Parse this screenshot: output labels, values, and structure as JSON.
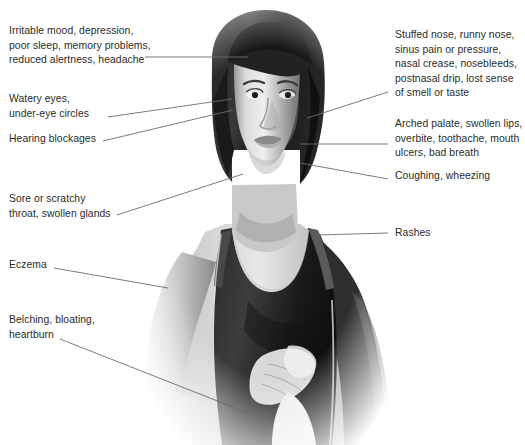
{
  "diagram": {
    "background_color": "#ffffff",
    "text_color": "#2b2b2b",
    "leader_line_color": "#6b6b6b",
    "figure_description": "Grayscale photographic illustration of a woman facing forward, shown from the head to the waist, wearing a dark sleeveless tank top, with one hand resting on her abdomen"
  },
  "labels": {
    "left": [
      {
        "id": "irritable-mood",
        "text": "Irritable mood, depression,\npoor sleep, memory problems,\nreduced alertness, headache"
      },
      {
        "id": "watery-eyes",
        "text": "Watery eyes,\nunder-eye circles"
      },
      {
        "id": "hearing-blockages",
        "text": "Hearing blockages"
      },
      {
        "id": "sore-throat",
        "text": "Sore or scratchy\nthroat, swollen glands"
      },
      {
        "id": "eczema",
        "text": "Eczema"
      },
      {
        "id": "belching",
        "text": "Belching, bloating,\nheartburn"
      }
    ],
    "right": [
      {
        "id": "stuffed-nose",
        "text": "Stuffed nose, runny nose,\nsinus pain or pressure,\nnasal crease, nosebleeds,\npostnasal drip, lost sense\nof smell or taste"
      },
      {
        "id": "arched-palate",
        "text": "Arched palate, swollen lips,\noverbite, toothache, mouth\nulcers, bad breath"
      },
      {
        "id": "coughing",
        "text": "Coughing,  wheezing"
      },
      {
        "id": "rashes",
        "text": "Rashes"
      }
    ]
  },
  "leader_lines": [
    {
      "id": "line-irritable",
      "x1": 145,
      "y1": 57,
      "x2": 248,
      "y2": 57
    },
    {
      "id": "line-watery",
      "x1": 108,
      "y1": 117,
      "x2": 232,
      "y2": 99
    },
    {
      "id": "line-hearing",
      "x1": 103,
      "y1": 141,
      "x2": 233,
      "y2": 110
    },
    {
      "id": "line-sore",
      "x1": 117,
      "y1": 215,
      "x2": 243,
      "y2": 174
    },
    {
      "id": "line-eczema",
      "x1": 54,
      "y1": 268,
      "x2": 168,
      "y2": 288
    },
    {
      "id": "line-belching",
      "x1": 60,
      "y1": 339,
      "x2": 248,
      "y2": 413
    },
    {
      "id": "line-stuffed",
      "x1": 307,
      "y1": 118,
      "x2": 388,
      "y2": 92
    },
    {
      "id": "line-arched",
      "x1": 300,
      "y1": 144,
      "x2": 388,
      "y2": 144
    },
    {
      "id": "line-coughing",
      "x1": 300,
      "y1": 163,
      "x2": 388,
      "y2": 179
    },
    {
      "id": "line-rashes",
      "x1": 318,
      "y1": 235,
      "x2": 388,
      "y2": 233
    }
  ]
}
